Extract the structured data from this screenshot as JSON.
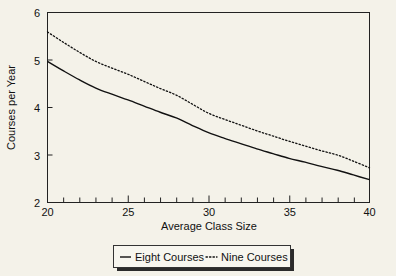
{
  "chart_data": {
    "type": "line",
    "title": "",
    "xlabel": "Average Class Size",
    "ylabel": "Courses per Year",
    "xlim": [
      20,
      40
    ],
    "ylim": [
      2,
      6
    ],
    "xticks": [
      20,
      25,
      30,
      35,
      40
    ],
    "xtick_labels": [
      "20",
      "25",
      "30",
      "35",
      "40"
    ],
    "yticks": [
      2,
      3,
      4,
      5,
      6
    ],
    "ytick_labels": [
      "2",
      "3",
      "4",
      "5",
      "6"
    ],
    "minor_xtick_step": 1,
    "grid": false,
    "legend_position": "below-axes",
    "x": [
      20,
      21,
      22,
      23,
      24,
      25,
      26,
      27,
      28,
      29,
      30,
      31,
      32,
      33,
      34,
      35,
      36,
      37,
      38,
      39,
      40
    ],
    "series": [
      {
        "name": "Eight Courses",
        "style": "solid",
        "color": "#111111",
        "values": [
          4.97,
          4.77,
          4.58,
          4.41,
          4.28,
          4.16,
          4.03,
          3.9,
          3.78,
          3.62,
          3.47,
          3.35,
          3.24,
          3.13,
          3.03,
          2.93,
          2.85,
          2.76,
          2.68,
          2.58,
          2.48
        ]
      },
      {
        "name": "Nine Courses",
        "style": "dotted",
        "color": "#111111",
        "values": [
          5.59,
          5.37,
          5.16,
          4.97,
          4.83,
          4.7,
          4.55,
          4.4,
          4.26,
          4.07,
          3.88,
          3.75,
          3.63,
          3.51,
          3.4,
          3.29,
          3.19,
          3.09,
          3.0,
          2.87,
          2.73
        ]
      }
    ]
  },
  "legend": {
    "items": [
      {
        "label": "Eight Courses",
        "style": "solid"
      },
      {
        "label": "Nine Courses",
        "style": "dotted"
      }
    ]
  },
  "colors": {
    "background": "#f4f2e9",
    "axis": "#222222",
    "text": "#111111",
    "legend_background": "#f7f6ef",
    "legend_shadow": "#2b2b2b"
  }
}
